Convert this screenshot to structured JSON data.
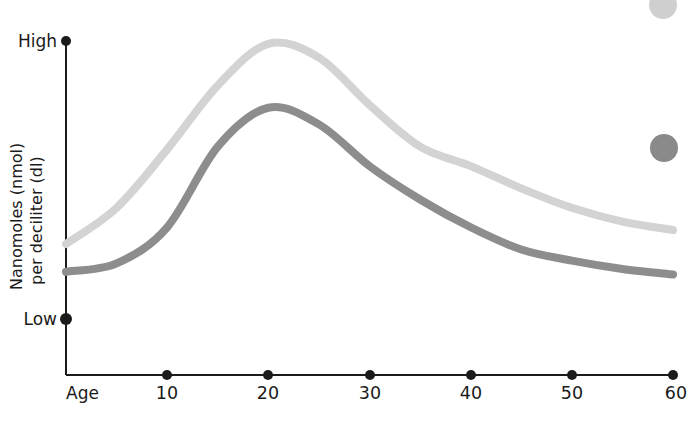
{
  "chart_data": {
    "type": "line",
    "title": "",
    "xlabel": "Age",
    "ylabel": "Nanomoles (nmol) per deciliter (dl)",
    "ylabel_line1": "Nanomoles (nmol)",
    "ylabel_line2": "per deciliter (dl)",
    "x": [
      0,
      5,
      10,
      15,
      20,
      25,
      30,
      35,
      40,
      45,
      50,
      55,
      60
    ],
    "xlim": [
      0,
      60
    ],
    "xticks": [
      10,
      20,
      30,
      40,
      50,
      60
    ],
    "xtick_labels": [
      "10",
      "20",
      "30",
      "40",
      "50",
      "60"
    ],
    "x_origin_label": "Age",
    "ylim": [
      0,
      100
    ],
    "yticks": [
      0,
      100
    ],
    "ytick_labels": [
      "Low",
      "High"
    ],
    "y_low_label": "Low",
    "y_high_label": "High",
    "grid": false,
    "legend_position": "right",
    "series": [
      {
        "name": "upper-curve",
        "color": "#d3d3d3",
        "legend_marker": "light-gray-dot",
        "values": [
          27,
          40,
          61,
          84,
          99,
          94,
          77,
          62,
          55,
          47,
          40,
          35,
          32
        ]
      },
      {
        "name": "lower-curve",
        "color": "#8d8d8d",
        "legend_marker": "dark-gray-dot",
        "values": [
          17,
          20,
          33,
          62,
          76,
          70,
          55,
          43,
          33,
          25,
          21,
          18,
          16
        ]
      }
    ],
    "annotations": {
      "peak_age_upper": 20,
      "peak_age_lower": 20
    }
  },
  "colors": {
    "axis": "#1b1b1b",
    "background": "#ffffff",
    "series_light": "#d3d3d3",
    "series_dark": "#8d8d8d",
    "text": "#1b1b1b"
  },
  "legend": {
    "items": [
      {
        "marker_name": "legend-dot-light",
        "color": "#cfcfcf",
        "label": ""
      },
      {
        "marker_name": "legend-dot-dark",
        "color": "#8a8a8a",
        "label": ""
      }
    ]
  }
}
